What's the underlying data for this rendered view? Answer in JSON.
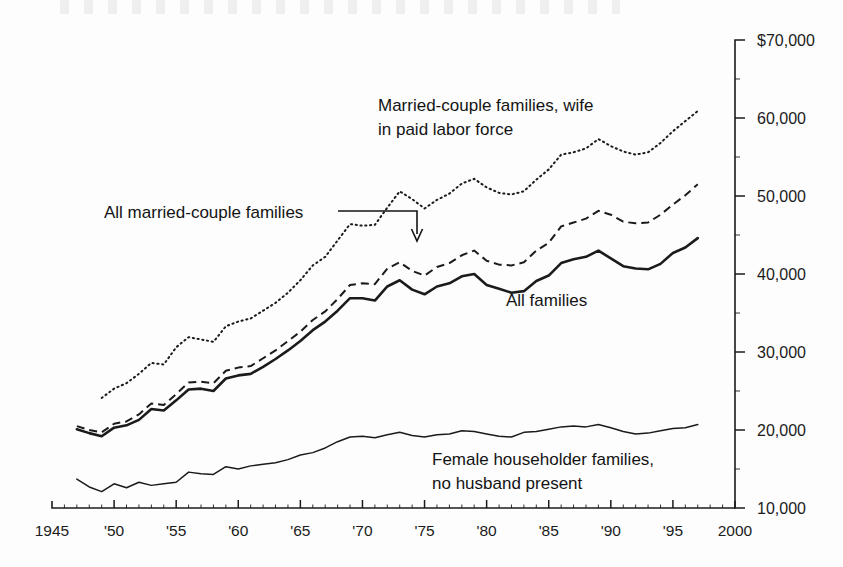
{
  "chart_data": {
    "type": "line",
    "title": "",
    "xlabel": "",
    "ylabel": "",
    "xlim": [
      1945,
      2000
    ],
    "ylim": [
      10000,
      70000
    ],
    "grid": false,
    "legend_position": "inline-annotations",
    "x_tick_labels": [
      "1945",
      "'50",
      "'55",
      "'60",
      "'65",
      "'70",
      "'75",
      "'80",
      "'85",
      "'90",
      "'95",
      "2000"
    ],
    "x_tick_values": [
      1945,
      1950,
      1955,
      1960,
      1965,
      1970,
      1975,
      1980,
      1985,
      1990,
      1995,
      2000
    ],
    "y_tick_labels": [
      "$70,000",
      "60,000",
      "50,000",
      "40,000",
      "30,000",
      "20,000",
      "10,000"
    ],
    "y_tick_values": [
      70000,
      60000,
      50000,
      40000,
      30000,
      20000,
      10000
    ],
    "series": [
      {
        "name": "Married-couple families, wife in paid labor force",
        "style": "dotted",
        "x": [
          1949,
          1950,
          1951,
          1952,
          1953,
          1954,
          1955,
          1956,
          1957,
          1958,
          1959,
          1960,
          1961,
          1962,
          1963,
          1964,
          1965,
          1966,
          1967,
          1968,
          1969,
          1970,
          1971,
          1972,
          1973,
          1974,
          1975,
          1976,
          1977,
          1978,
          1979,
          1980,
          1981,
          1982,
          1983,
          1984,
          1985,
          1986,
          1987,
          1988,
          1989,
          1990,
          1991,
          1992,
          1993,
          1994,
          1995,
          1996,
          1997
        ],
        "values": [
          24100,
          25300,
          26000,
          27200,
          28600,
          28400,
          30600,
          31900,
          31600,
          31300,
          33300,
          33900,
          34300,
          35300,
          36300,
          37600,
          39200,
          41100,
          42200,
          44300,
          46400,
          46200,
          46300,
          48500,
          50600,
          49600,
          48400,
          49500,
          50300,
          51600,
          52200,
          51100,
          50400,
          50200,
          50600,
          52100,
          53400,
          55300,
          55600,
          56100,
          57300,
          56400,
          55700,
          55300,
          55600,
          56800,
          58300,
          59600,
          60900
        ]
      },
      {
        "name": "All married-couple families",
        "style": "dashed",
        "x": [
          1947,
          1948,
          1949,
          1950,
          1951,
          1952,
          1953,
          1954,
          1955,
          1956,
          1957,
          1958,
          1959,
          1960,
          1961,
          1962,
          1963,
          1964,
          1965,
          1966,
          1967,
          1968,
          1969,
          1970,
          1971,
          1972,
          1973,
          1974,
          1975,
          1976,
          1977,
          1978,
          1979,
          1980,
          1981,
          1982,
          1983,
          1984,
          1985,
          1986,
          1987,
          1988,
          1989,
          1990,
          1991,
          1992,
          1993,
          1994,
          1995,
          1996,
          1997
        ],
        "values": [
          20500,
          20000,
          19700,
          20800,
          21100,
          22000,
          23400,
          23200,
          24600,
          26100,
          26200,
          26000,
          27600,
          28000,
          28200,
          29200,
          30200,
          31400,
          32600,
          34100,
          35200,
          36800,
          38600,
          38800,
          38700,
          40700,
          41500,
          40400,
          39800,
          40900,
          41400,
          42400,
          43000,
          41700,
          41200,
          41100,
          41500,
          43000,
          44000,
          46100,
          46600,
          47100,
          48100,
          47600,
          46700,
          46500,
          46600,
          47600,
          48900,
          50100,
          51500
        ]
      },
      {
        "name": "All families",
        "style": "solid-thick",
        "x": [
          1947,
          1948,
          1949,
          1950,
          1951,
          1952,
          1953,
          1954,
          1955,
          1956,
          1957,
          1958,
          1959,
          1960,
          1961,
          1962,
          1963,
          1964,
          1965,
          1966,
          1967,
          1968,
          1969,
          1970,
          1971,
          1972,
          1973,
          1974,
          1975,
          1976,
          1977,
          1978,
          1979,
          1980,
          1981,
          1982,
          1983,
          1984,
          1985,
          1986,
          1987,
          1988,
          1989,
          1990,
          1991,
          1992,
          1993,
          1994,
          1995,
          1996,
          1997
        ],
        "values": [
          20100,
          19600,
          19200,
          20300,
          20600,
          21300,
          22700,
          22500,
          23800,
          25200,
          25300,
          25000,
          26600,
          27000,
          27200,
          28100,
          29100,
          30200,
          31400,
          32800,
          33900,
          35300,
          36900,
          36900,
          36600,
          38400,
          39200,
          38000,
          37400,
          38400,
          38800,
          39700,
          40000,
          38600,
          38100,
          37600,
          37800,
          39100,
          39800,
          41400,
          41900,
          42200,
          43000,
          42000,
          41000,
          40700,
          40600,
          41300,
          42700,
          43400,
          44600
        ]
      },
      {
        "name": "Female householder families, no husband present",
        "style": "solid-thin",
        "x": [
          1947,
          1948,
          1949,
          1950,
          1951,
          1952,
          1953,
          1954,
          1955,
          1956,
          1957,
          1958,
          1959,
          1960,
          1961,
          1962,
          1963,
          1964,
          1965,
          1966,
          1967,
          1968,
          1969,
          1970,
          1971,
          1972,
          1973,
          1974,
          1975,
          1976,
          1977,
          1978,
          1979,
          1980,
          1981,
          1982,
          1983,
          1984,
          1985,
          1986,
          1987,
          1988,
          1989,
          1990,
          1991,
          1992,
          1993,
          1994,
          1995,
          1996,
          1997
        ],
        "values": [
          13700,
          12700,
          12100,
          13100,
          12600,
          13300,
          12900,
          13100,
          13300,
          14600,
          14400,
          14300,
          15300,
          15000,
          15400,
          15600,
          15800,
          16200,
          16800,
          17100,
          17700,
          18500,
          19100,
          19200,
          19000,
          19400,
          19700,
          19300,
          19100,
          19400,
          19500,
          19900,
          19800,
          19500,
          19200,
          19100,
          19700,
          19800,
          20100,
          20400,
          20500,
          20400,
          20700,
          20300,
          19800,
          19500,
          19600,
          19900,
          20200,
          20300,
          20700
        ]
      }
    ],
    "annotations": [
      {
        "id": "married-wife-labor-force",
        "lines": [
          "Married-couple families, wife",
          "in paid labor force"
        ]
      },
      {
        "id": "all-married-couple",
        "lines": [
          "All married-couple families"
        ],
        "has_leader_arrow": true
      },
      {
        "id": "all-families",
        "lines": [
          "All families"
        ]
      },
      {
        "id": "female-householder",
        "lines": [
          "Female householder families,",
          "no husband present"
        ]
      }
    ],
    "colors": {
      "ink": "#1b1b1b",
      "background": "#fdfdfd"
    }
  }
}
